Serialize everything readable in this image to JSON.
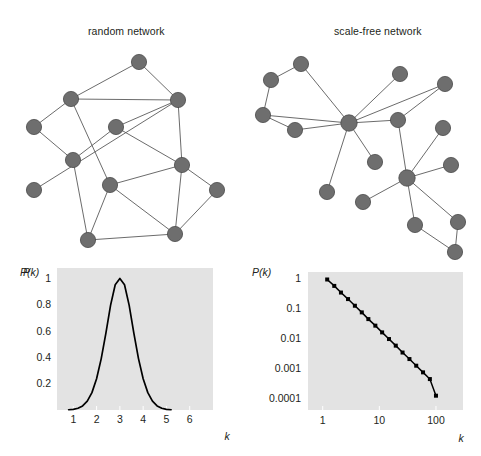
{
  "figure": {
    "background": "#ffffff",
    "node_color": "#6e6e6e",
    "node_edge_color": "#4a4a4a",
    "link_color": "#5a5a5a",
    "panel_background": "#e3e3e3",
    "curve_color": "#000000"
  },
  "panels": {
    "random": {
      "title": "random network"
    },
    "scalefree": {
      "title": "scale-free network"
    }
  },
  "networks": {
    "random": {
      "name": "random-network-graph",
      "node_count": 12,
      "nodes": [
        {
          "id": 0,
          "x": 119,
          "y": 20
        },
        {
          "id": 1,
          "x": 51,
          "y": 57
        },
        {
          "id": 2,
          "x": 158,
          "y": 58
        },
        {
          "id": 3,
          "x": 14,
          "y": 85
        },
        {
          "id": 4,
          "x": 96,
          "y": 85
        },
        {
          "id": 5,
          "x": 53,
          "y": 118
        },
        {
          "id": 6,
          "x": 162,
          "y": 123
        },
        {
          "id": 7,
          "x": 90,
          "y": 143
        },
        {
          "id": 8,
          "x": 197,
          "y": 148
        },
        {
          "id": 9,
          "x": 68,
          "y": 198
        },
        {
          "id": 10,
          "x": 155,
          "y": 192
        },
        {
          "id": 11,
          "x": 14,
          "y": 148
        }
      ],
      "edges": [
        [
          0,
          1
        ],
        [
          0,
          2
        ],
        [
          1,
          2
        ],
        [
          1,
          3
        ],
        [
          1,
          7
        ],
        [
          2,
          4
        ],
        [
          2,
          6
        ],
        [
          3,
          5
        ],
        [
          4,
          5
        ],
        [
          4,
          6
        ],
        [
          5,
          9
        ],
        [
          6,
          8
        ],
        [
          6,
          7
        ],
        [
          6,
          10
        ],
        [
          7,
          9
        ],
        [
          7,
          10
        ],
        [
          8,
          10
        ],
        [
          9,
          10
        ],
        [
          2,
          11
        ]
      ]
    },
    "scalefree": {
      "name": "scale-free-network-graph",
      "node_count": 17,
      "hub_ids": [
        5,
        12
      ],
      "nodes": [
        {
          "id": 0,
          "x": 46,
          "y": 22
        },
        {
          "id": 1,
          "x": 16,
          "y": 38
        },
        {
          "id": 2,
          "x": 8,
          "y": 73
        },
        {
          "id": 3,
          "x": 40,
          "y": 88
        },
        {
          "id": 4,
          "x": 145,
          "y": 32
        },
        {
          "id": 5,
          "x": 94,
          "y": 81
        },
        {
          "id": 6,
          "x": 190,
          "y": 42
        },
        {
          "id": 7,
          "x": 143,
          "y": 78
        },
        {
          "id": 8,
          "x": 72,
          "y": 150
        },
        {
          "id": 9,
          "x": 188,
          "y": 86
        },
        {
          "id": 10,
          "x": 196,
          "y": 123
        },
        {
          "id": 11,
          "x": 108,
          "y": 160
        },
        {
          "id": 12,
          "x": 152,
          "y": 136
        },
        {
          "id": 13,
          "x": 160,
          "y": 183
        },
        {
          "id": 14,
          "x": 203,
          "y": 180
        },
        {
          "id": 15,
          "x": 200,
          "y": 210
        },
        {
          "id": 16,
          "x": 120,
          "y": 120
        }
      ],
      "edges": [
        [
          0,
          1
        ],
        [
          0,
          5
        ],
        [
          1,
          2
        ],
        [
          2,
          5
        ],
        [
          2,
          3
        ],
        [
          3,
          5
        ],
        [
          4,
          5
        ],
        [
          5,
          6
        ],
        [
          5,
          7
        ],
        [
          5,
          8
        ],
        [
          5,
          16
        ],
        [
          6,
          7
        ],
        [
          7,
          12
        ],
        [
          9,
          12
        ],
        [
          10,
          12
        ],
        [
          11,
          12
        ],
        [
          12,
          13
        ],
        [
          12,
          14
        ],
        [
          13,
          15
        ],
        [
          14,
          15
        ]
      ]
    }
  },
  "chart_data": [
    {
      "name": "random-degree-distribution",
      "type": "line",
      "title": "",
      "xlabel": "k",
      "ylabel": "P(k)",
      "xscale": "linear",
      "yscale": "linear",
      "xlim": [
        0.3,
        7.0
      ],
      "ylim": [
        0,
        1.08
      ],
      "xticks": [
        1,
        2,
        3,
        4,
        5,
        6
      ],
      "xticklabels": [
        "1",
        "2",
        "3",
        "4",
        "5",
        "6"
      ],
      "yticks": [
        0.2,
        0.4,
        0.6,
        0.8,
        1
      ],
      "yticklabels": [
        "0.2",
        "0.4",
        "0.6",
        "0.8",
        "1"
      ],
      "grid": false,
      "distribution": "gaussian",
      "peak_k": 3,
      "peak_value": 1.0,
      "sigma": 0.62,
      "x": [
        0.8,
        1.0,
        1.2,
        1.4,
        1.6,
        1.8,
        2.0,
        2.2,
        2.4,
        2.6,
        2.8,
        3.0,
        3.2,
        3.4,
        3.6,
        3.8,
        4.0,
        4.2,
        4.4,
        4.6,
        4.8,
        5.0,
        5.2
      ],
      "values": [
        0.002,
        0.005,
        0.013,
        0.031,
        0.067,
        0.132,
        0.238,
        0.391,
        0.585,
        0.796,
        0.953,
        1.0,
        0.953,
        0.796,
        0.585,
        0.391,
        0.238,
        0.132,
        0.067,
        0.031,
        0.013,
        0.005,
        0.002
      ]
    },
    {
      "name": "scalefree-degree-distribution",
      "type": "line",
      "title": "",
      "xlabel": "k",
      "ylabel": "P(k)",
      "xscale": "log",
      "yscale": "log",
      "xlim": [
        0.55,
        300
      ],
      "ylim": [
        4e-05,
        1.6
      ],
      "xticks": [
        1,
        10,
        100
      ],
      "xticklabels": [
        "1",
        "10",
        "100"
      ],
      "yticks": [
        1,
        0.1,
        0.01,
        0.001,
        0.0001
      ],
      "yticklabels": [
        "1",
        "0.1",
        "0.01",
        "0.001",
        "0.0001"
      ],
      "grid": false,
      "marker": "square",
      "exponent": -2.0,
      "x": [
        1.2,
        1.6,
        2.1,
        2.8,
        3.7,
        4.9,
        6.4,
        8.5,
        11.2,
        14.8,
        19.5,
        25.7,
        34.0,
        44.8,
        59.1,
        78.0,
        100.0
      ],
      "values": [
        0.9,
        0.55,
        0.33,
        0.2,
        0.12,
        0.072,
        0.043,
        0.026,
        0.0155,
        0.0093,
        0.0056,
        0.0033,
        0.002,
        0.0012,
        0.00072,
        0.00043,
        0.00012
      ]
    }
  ]
}
